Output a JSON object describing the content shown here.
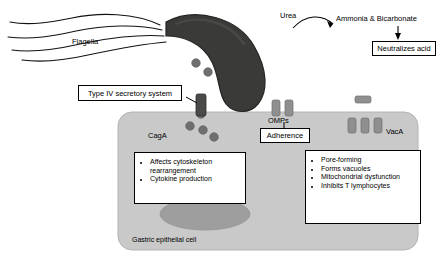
{
  "figure": {
    "colors": {
      "bacterium_body": "#3a3a38",
      "bacterium_outline": "#2b2b29",
      "cell_fill": "#c9c9c9",
      "cell_outline": "#a8a8a8",
      "nucleus_fill": "#9a9a9a",
      "protein_dot": "#6f6f6f",
      "omp_rect": "#8a8a8a",
      "flagella_line": "#000000",
      "arrow": "#000000",
      "box_border": "#000000",
      "box_fill": "#ffffff",
      "text": "#000000"
    }
  },
  "labels": {
    "flagella": "Flagella",
    "urea": "Urea",
    "ammonia_bicarbonate": "Ammonia & Bicarbonate",
    "neutralizes_acid": "Neutralizes acid",
    "type_iv": "Type IV secretory system",
    "omps": "OMPs",
    "adherence": "Adherence",
    "caga": "CagA",
    "vaca": "VacA",
    "gastric_cell": "Gastric epithelial cell"
  },
  "caga_effects": [
    "Affects cytoskeleton",
    "rearrangement",
    "Cytokine production"
  ],
  "caga_effects_items": [
    "Affects cytoskeleton rearrangement",
    "Cytokine production"
  ],
  "vaca_effects_items": [
    "Pore-forming",
    "Forms vacuoles",
    "Mitochondrial dysfunction",
    "Inhibits T lymphocytes"
  ]
}
